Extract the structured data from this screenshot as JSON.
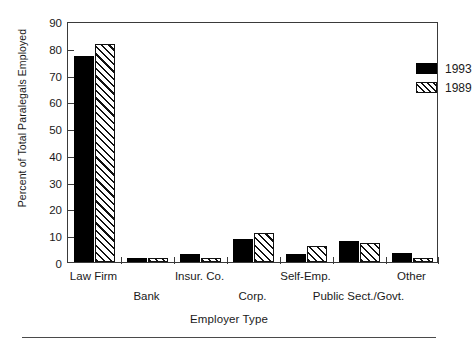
{
  "chart_data": {
    "type": "bar",
    "title": "",
    "xlabel": "Employer Type",
    "ylabel": "Percent of Total Paralegals Employed",
    "categories": [
      "Law Firm",
      "Bank",
      "Insur. Co.",
      "Corp.",
      "Self-Emp.",
      "Public Sect./Govt.",
      "Other"
    ],
    "series": [
      {
        "name": "1993",
        "pattern": "solid",
        "color": "#000000",
        "values": [
          77,
          1.5,
          3,
          8.5,
          3,
          8,
          3.5
        ]
      },
      {
        "name": "1989",
        "pattern": "hatch",
        "color": "#ffffff",
        "values": [
          81.5,
          1.5,
          1.5,
          11,
          6,
          7,
          1.5
        ]
      }
    ],
    "ylim": [
      0,
      90
    ],
    "ytick_step": 10,
    "yticks": [
      "0",
      "10",
      "20",
      "30",
      "40",
      "50",
      "60",
      "70",
      "80",
      "90"
    ],
    "grid": false,
    "legend_position": "top-right",
    "legend_entries": [
      "1993",
      "1989"
    ]
  },
  "axes": {
    "y_title": "Percent of Total Paralegals Employed",
    "x_title": "Employer Type"
  },
  "legend": {
    "entries": [
      {
        "label": "1993",
        "pattern": "solid"
      },
      {
        "label": "1989",
        "pattern": "hatch"
      }
    ]
  }
}
